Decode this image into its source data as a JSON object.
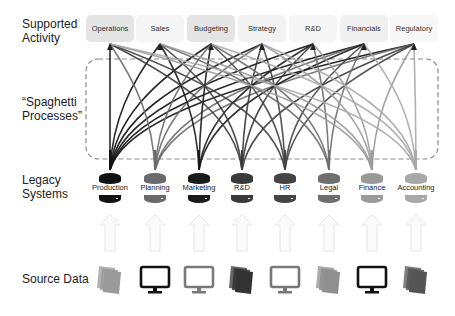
{
  "row_labels": {
    "supported_activity": [
      "Supported",
      "Activity"
    ],
    "spaghetti": [
      "“Spaghetti",
      "Processes”"
    ],
    "legacy": [
      "Legacy",
      "Systems"
    ],
    "source": "Source Data"
  },
  "activities": [
    {
      "label": "Operations",
      "x": 110,
      "bg": "#e4e4e4"
    },
    {
      "label": "Sales",
      "x": 160,
      "bg": "#f5f5f5"
    },
    {
      "label": "Budgeting",
      "x": 211,
      "bg": "#e4e4e4"
    },
    {
      "label": "Strategy",
      "x": 262,
      "bg": "#f2f2f2"
    },
    {
      "label": "R&D",
      "x": 313,
      "bg": "#f5f5f5"
    },
    {
      "label": "Financials",
      "x": 364,
      "bg": "#f0f0f0"
    },
    {
      "label": "Regulatory",
      "x": 414,
      "bg": "#f7f7f7"
    }
  ],
  "legacy_systems": [
    {
      "label": "Production",
      "x": 110,
      "color": "#111111"
    },
    {
      "label": "Planning",
      "x": 155,
      "color": "#6a6a6a"
    },
    {
      "label": "Marketing",
      "x": 199,
      "color": "#1a1a1a"
    },
    {
      "label": "R&D",
      "x": 242,
      "color": "#3a3a3a"
    },
    {
      "label": "HR",
      "x": 285,
      "color": "#444444"
    },
    {
      "label": "Legal",
      "x": 329,
      "color": "#6e6e6e"
    },
    {
      "label": "Finance",
      "x": 372,
      "color": "#9a9a9a"
    },
    {
      "label": "Accounting",
      "x": 416,
      "color": "#a8a8a8"
    }
  ],
  "source_data": [
    {
      "type": "documents-icon",
      "x": 110,
      "color": "#9a9a9a"
    },
    {
      "type": "monitor-icon",
      "x": 155,
      "color": "#111111"
    },
    {
      "type": "monitor-icon",
      "x": 199,
      "color": "#7a7a7a"
    },
    {
      "type": "documents-icon",
      "x": 242,
      "color": "#333333"
    },
    {
      "type": "monitor-icon",
      "x": 285,
      "color": "#777777"
    },
    {
      "type": "documents-icon",
      "x": 329,
      "color": "#8f8f8f"
    },
    {
      "type": "monitor-icon",
      "x": 372,
      "color": "#111111"
    },
    {
      "type": "documents-icon",
      "x": 416,
      "color": "#555555"
    }
  ],
  "connections": {
    "note": "each legacy system connects to many activities",
    "spaghetti_box": {
      "x": 86,
      "y": 59,
      "w": 352,
      "h": 100
    }
  }
}
